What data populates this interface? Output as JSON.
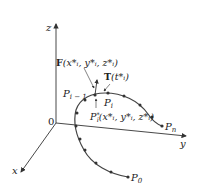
{
  "diagram": {
    "axes": {
      "z_label": "z",
      "y_label": "y",
      "x_label": "x",
      "origin_label": "0"
    },
    "points": {
      "start": "P",
      "start_sub": "0",
      "end": "P",
      "end_sub": "n",
      "prev": "P",
      "prev_sub": "i − 1",
      "current": "P",
      "current_sub": "i",
      "sample": "P",
      "sample_sup": "*",
      "sample_sub": "i",
      "sample_coords": "(x",
      "sample_coords_full": "(x*ᵢ, y*ᵢ, z*ᵢ)"
    },
    "annotations": {
      "field_label_bold": "F",
      "field_label_args": "(x*ᵢ, y*ᵢ, z*ᵢ)",
      "tangent_label_bold": "T",
      "tangent_label_args": "(t*ᵢ)"
    },
    "colors": {
      "line": "#333333",
      "curve": "#444444",
      "dot": "#333333",
      "text": "#222222"
    }
  }
}
